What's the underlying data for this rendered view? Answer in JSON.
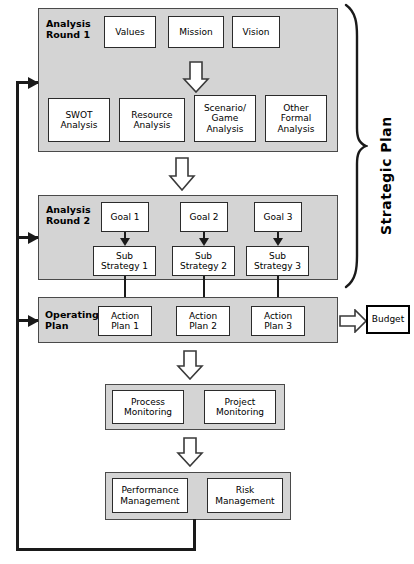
{
  "diagram": {
    "colors": {
      "panel_fill": "#d4d4d4",
      "panel_border": "#4a4a4a",
      "box_fill": "#ffffff",
      "box_border": "#2b2b2b",
      "line": "#1a1a1a",
      "background": "#ffffff"
    },
    "side_label": "Strategic Plan",
    "panels": {
      "round1": {
        "label": "Analysis\nRound 1",
        "top_row": [
          {
            "label": "Values"
          },
          {
            "label": "Mission"
          },
          {
            "label": "Vision"
          }
        ],
        "bottom_row": [
          {
            "label": "SWOT\nAnalysis"
          },
          {
            "label": "Resource\nAnalysis"
          },
          {
            "label": "Scenario/\nGame\nAnalysis"
          },
          {
            "label": "Other\nFormal\nAnalysis"
          }
        ]
      },
      "round2": {
        "label": "Analysis\nRound 2",
        "goals": [
          {
            "label": "Goal 1"
          },
          {
            "label": "Goal 2"
          },
          {
            "label": "Goal 3"
          }
        ],
        "substrategies": [
          {
            "label": "Sub\nStrategy 1"
          },
          {
            "label": "Sub\nStrategy 2"
          },
          {
            "label": "Sub\nStrategy 3"
          }
        ]
      },
      "operating": {
        "label": "Operating\nPlan",
        "action_plans": [
          {
            "label": "Action\nPlan 1"
          },
          {
            "label": "Action\nPlan 2"
          },
          {
            "label": "Action\nPlan 3"
          }
        ]
      },
      "monitoring": {
        "items": [
          {
            "label": "Process\nMonitoring"
          },
          {
            "label": "Project\nMonitoring"
          }
        ]
      },
      "management": {
        "items": [
          {
            "label": "Performance\nManagement"
          },
          {
            "label": "Risk\nManagement"
          }
        ]
      }
    },
    "budget": {
      "label": "Budget"
    }
  }
}
